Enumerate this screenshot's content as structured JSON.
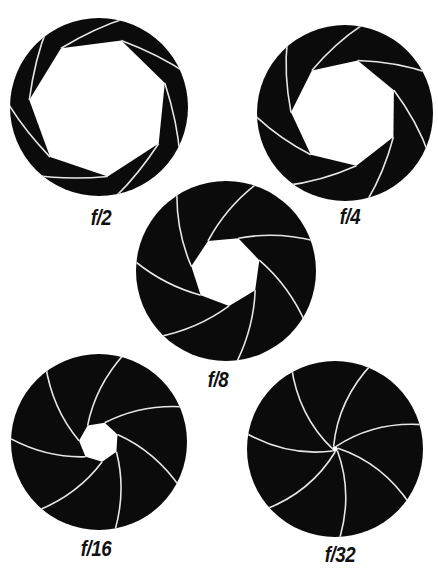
{
  "diagram": {
    "colors": {
      "blade": "#0b0b0b",
      "blade_edge": "#e6e6e6",
      "background": "#ffffff",
      "label": "#111111"
    },
    "blade_count": 7,
    "apertures": [
      {
        "id": "f2",
        "label": "f/2",
        "cx": 99,
        "cy": 107,
        "r": 89,
        "opening": 70,
        "rot": -20,
        "label_x": 101,
        "label_y": 207
      },
      {
        "id": "f4",
        "label": "f/4",
        "cx": 345,
        "cy": 113,
        "r": 88,
        "opening": 54,
        "rot": -25,
        "label_x": 350,
        "label_y": 206
      },
      {
        "id": "f8",
        "label": "f/8",
        "cx": 226,
        "cy": 271,
        "r": 90,
        "opening": 35,
        "rot": -18,
        "label_x": 218,
        "label_y": 369
      },
      {
        "id": "f16",
        "label": "f/16",
        "cx": 99,
        "cy": 442,
        "r": 88,
        "opening": 20,
        "rot": -22,
        "label_x": 96,
        "label_y": 538
      },
      {
        "id": "f32",
        "label": "f/32",
        "cx": 335,
        "cy": 449,
        "r": 88,
        "opening": 3,
        "rot": -15,
        "label_x": 340,
        "label_y": 544
      }
    ]
  }
}
